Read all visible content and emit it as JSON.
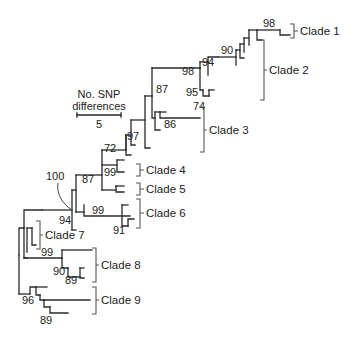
{
  "figure": {
    "type": "phylogenetic-tree",
    "scale_bar": {
      "title_line1": "No. SNP",
      "title_line2": "differences",
      "value": "5"
    },
    "clades": [
      {
        "label": "Clade 1"
      },
      {
        "label": "Clade 2"
      },
      {
        "label": "Clade 3"
      },
      {
        "label": "Clade 4"
      },
      {
        "label": "Clade 5"
      },
      {
        "label": "Clade 6"
      },
      {
        "label": "Clade 7"
      },
      {
        "label": "Clade 8"
      },
      {
        "label": "Clade 9"
      }
    ],
    "bootstrap_values": [
      {
        "value": "98",
        "note": "Clade 1 node"
      },
      {
        "value": "90"
      },
      {
        "value": "94"
      },
      {
        "value": "98"
      },
      {
        "value": "95"
      },
      {
        "value": "74"
      },
      {
        "value": "87"
      },
      {
        "value": "86"
      },
      {
        "value": "97"
      },
      {
        "value": "72"
      },
      {
        "value": "99",
        "note": "Clade 4 node"
      },
      {
        "value": "87"
      },
      {
        "value": "100",
        "note": "annotated with curved pointer"
      },
      {
        "value": "94"
      },
      {
        "value": "99",
        "note": "Clade 6 node"
      },
      {
        "value": "91"
      },
      {
        "value": "99",
        "note": "Clade 7 node"
      },
      {
        "value": "90"
      },
      {
        "value": "89"
      },
      {
        "value": "96"
      },
      {
        "value": "89"
      }
    ]
  }
}
